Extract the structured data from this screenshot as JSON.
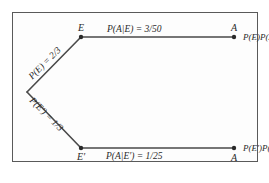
{
  "diagram": {
    "type": "probability-tree",
    "nodes": {
      "root": {
        "label": ""
      },
      "E": {
        "label": "E"
      },
      "E_prime": {
        "label": "E′"
      },
      "A_top": {
        "label": "A"
      },
      "A_bottom": {
        "label": "A"
      }
    },
    "branches": {
      "root_to_E": {
        "label": "P(E) = 2/3"
      },
      "root_to_E_prime": {
        "label": "P(E′) = 1/3"
      },
      "E_to_A": {
        "label": "P(A|E) = 3/50"
      },
      "E_prime_to_A": {
        "label": "P(A|E′) = 1/25"
      }
    },
    "outcomes": {
      "top": "P(E)P(A|E)",
      "bottom": "P(E′)P(A|E′)"
    },
    "colors": {
      "line": "#4a4a4a",
      "border": "#5a5a5a",
      "text": "#2a2a2a",
      "background": "#ffffff"
    }
  }
}
